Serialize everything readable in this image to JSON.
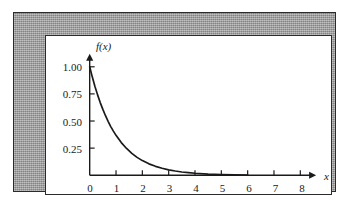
{
  "figure": {
    "frame_color": "#9e9e9e",
    "panel_color": "#ffffff",
    "ink_color": "#1a1a1a"
  },
  "chart_data": {
    "type": "line",
    "title": "",
    "xlabel": "x",
    "ylabel": "f(x)",
    "xlim": [
      0,
      8.6
    ],
    "ylim": [
      0,
      1.12
    ],
    "grid": false,
    "legend": null,
    "function": "f(x) = e^(-x)",
    "xticks": [
      0,
      1,
      2,
      3,
      4,
      5,
      6,
      7,
      8
    ],
    "xticklabels": [
      "0",
      "1",
      "2",
      "3",
      "4",
      "5",
      "6",
      "7",
      "8"
    ],
    "yticks": [
      0.25,
      0.5,
      0.75,
      1.0
    ],
    "yticklabels": [
      "0.25",
      "0.50",
      "0.75",
      "1.00"
    ],
    "axis_arrows": {
      "x": true,
      "y": true
    },
    "series": [
      {
        "name": "f(x) = e^(-x)",
        "color": "#1a1a1a",
        "x": [
          0.0,
          0.1,
          0.2,
          0.3,
          0.4,
          0.5,
          0.6,
          0.7,
          0.8,
          0.9,
          1.0,
          1.2,
          1.4,
          1.6,
          1.8,
          2.0,
          2.25,
          2.5,
          2.75,
          3.0,
          3.25,
          3.5,
          3.75,
          4.0,
          4.5,
          5.0,
          5.5,
          6.0
        ],
        "y": [
          1.0,
          0.905,
          0.819,
          0.741,
          0.67,
          0.607,
          0.549,
          0.497,
          0.449,
          0.407,
          0.368,
          0.301,
          0.247,
          0.202,
          0.165,
          0.135,
          0.105,
          0.082,
          0.064,
          0.05,
          0.039,
          0.03,
          0.024,
          0.018,
          0.011,
          0.007,
          0.004,
          0.002
        ]
      }
    ]
  }
}
